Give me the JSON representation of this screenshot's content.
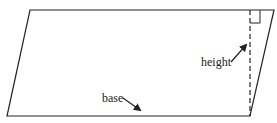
{
  "diagram": {
    "shape": "parallelogram",
    "labels": {
      "height": "height",
      "base": "base"
    },
    "colors": {
      "stroke": "#222222",
      "background": "#ffffff"
    },
    "annotations": [
      "right-angle marker at top of height line",
      "dashed height line"
    ]
  }
}
